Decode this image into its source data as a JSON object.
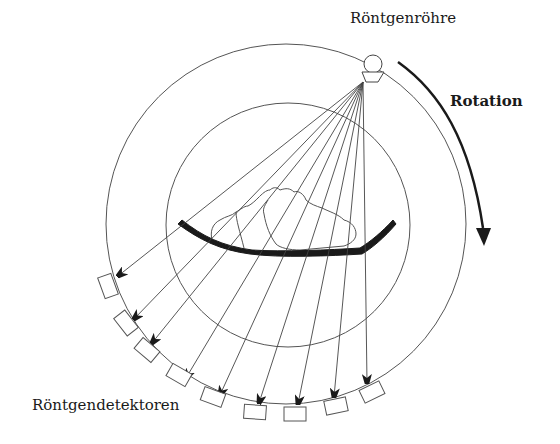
{
  "diagram": {
    "type": "ct-scanner-schematic",
    "labels": {
      "tube": "Röntgenröhre",
      "rotation": "Rotation",
      "detectors": "Röntgendetektoren"
    },
    "colors": {
      "line": "#3a3a3a",
      "fill_dark": "#1a1a1a",
      "background": "#ffffff"
    },
    "components": {
      "outer_ring": {
        "cx": 286,
        "cy": 224,
        "r": 180
      },
      "inner_ring": {
        "cx": 288,
        "cy": 225,
        "r": 122
      },
      "xray_tube": {
        "cx": 373,
        "cy": 64,
        "r": 8
      },
      "beam_source": {
        "x": 363,
        "y": 82
      },
      "rotation_direction": "clockwise",
      "detector_count": 9,
      "beam_count": 9
    }
  }
}
